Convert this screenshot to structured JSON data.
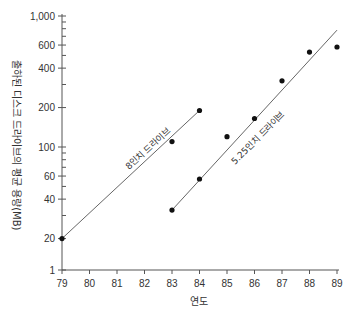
{
  "chart_data": {
    "type": "scatter",
    "title": "",
    "xlabel": "연도",
    "ylabel": "출하된 디스크 드라이브의 평균 용량(MB)",
    "yscale": "log",
    "ylim": [
      1,
      1000
    ],
    "xlim": [
      79,
      89
    ],
    "x_ticks": [
      "79",
      "80",
      "81",
      "82",
      "83",
      "84",
      "85",
      "86",
      "87",
      "88",
      "89"
    ],
    "y_ticks": [
      {
        "value": 1000,
        "label": "1,000"
      },
      {
        "value": 600,
        "label": "600"
      },
      {
        "value": 400,
        "label": "400"
      },
      {
        "value": 200,
        "label": "200"
      },
      {
        "value": 100,
        "label": "100"
      },
      {
        "value": 60,
        "label": "60"
      },
      {
        "value": 40,
        "label": "40"
      },
      {
        "value": 20,
        "label": "20"
      },
      {
        "value": 1,
        "label": "1"
      }
    ],
    "grid": false,
    "legend": "inline labels along trend lines",
    "series": [
      {
        "name": "8인치 드라이브",
        "points": [
          {
            "x": 79,
            "y": 20
          },
          {
            "x": 83,
            "y": 110
          },
          {
            "x": 84,
            "y": 190
          }
        ],
        "trend_line": [
          {
            "x": 79,
            "y": 20
          },
          {
            "x": 84,
            "y": 190
          }
        ]
      },
      {
        "name": "5.25인치 드라이브",
        "points": [
          {
            "x": 83,
            "y": 33
          },
          {
            "x": 84,
            "y": 57
          },
          {
            "x": 85,
            "y": 120
          },
          {
            "x": 86,
            "y": 165
          },
          {
            "x": 87,
            "y": 320
          },
          {
            "x": 88,
            "y": 530
          },
          {
            "x": 89,
            "y": 580
          }
        ],
        "trend_line": [
          {
            "x": 83,
            "y": 33
          },
          {
            "x": 89,
            "y": 780
          }
        ]
      }
    ]
  }
}
